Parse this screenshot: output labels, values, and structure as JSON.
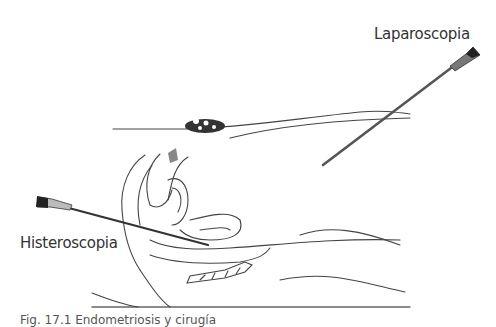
{
  "figure": {
    "labels": {
      "laparoscopy": "Laparoscopia",
      "hysteroscopy": "Histeroscopia"
    },
    "caption": "Fig. 17.1  Endometriosis y cirugía",
    "colors": {
      "line": "#333333",
      "instrument_shaft": "#555555",
      "background": "#ffffff"
    }
  }
}
